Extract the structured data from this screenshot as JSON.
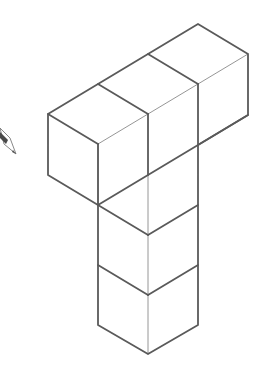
{
  "figure": {
    "cube_count": 5,
    "stroke_color": "#5a5a5a",
    "thin_stroke_color": "#8a8a8a",
    "background": "#ffffff"
  },
  "shapes": {
    "outline": [
      [
        48,
        114
      ],
      [
        98,
        84
      ],
      [
        148,
        54
      ],
      [
        198,
        24
      ],
      [
        248,
        54
      ],
      [
        248,
        115
      ],
      [
        198,
        145
      ],
      [
        198,
        325
      ],
      [
        148,
        354
      ],
      [
        98,
        325
      ],
      [
        98,
        205
      ],
      [
        48,
        175
      ]
    ],
    "bold_edges": [
      [
        [
          48,
          114
        ],
        [
          98,
          144
        ]
      ],
      [
        [
          98,
          144
        ],
        [
          98,
          205
        ]
      ],
      [
        [
          98,
          84
        ],
        [
          148,
          114
        ]
      ],
      [
        [
          148,
          54
        ],
        [
          198,
          84
        ]
      ],
      [
        [
          198,
          84
        ],
        [
          198,
          145
        ]
      ],
      [
        [
          148,
          114
        ],
        [
          148,
          175
        ]
      ],
      [
        [
          98,
          205
        ],
        [
          248,
          115
        ]
      ],
      [
        [
          98,
          205
        ],
        [
          148,
          235
        ]
      ],
      [
        [
          148,
          235
        ],
        [
          198,
          205
        ]
      ],
      [
        [
          98,
          265
        ],
        [
          148,
          295
        ]
      ],
      [
        [
          148,
          295
        ],
        [
          198,
          265
        ]
      ]
    ],
    "thin_edges": [
      [
        [
          98,
          144
        ],
        [
          148,
          114
        ]
      ],
      [
        [
          148,
          114
        ],
        [
          198,
          84
        ]
      ],
      [
        [
          198,
          84
        ],
        [
          248,
          54
        ]
      ],
      [
        [
          148,
          175
        ],
        [
          148,
          235
        ]
      ],
      [
        [
          148,
          235
        ],
        [
          148,
          354
        ]
      ],
      [
        [
          98,
          144
        ],
        [
          98,
          205
        ]
      ]
    ]
  },
  "pencil_icon": {
    "name": "pencil",
    "x": 0,
    "y": 125
  }
}
